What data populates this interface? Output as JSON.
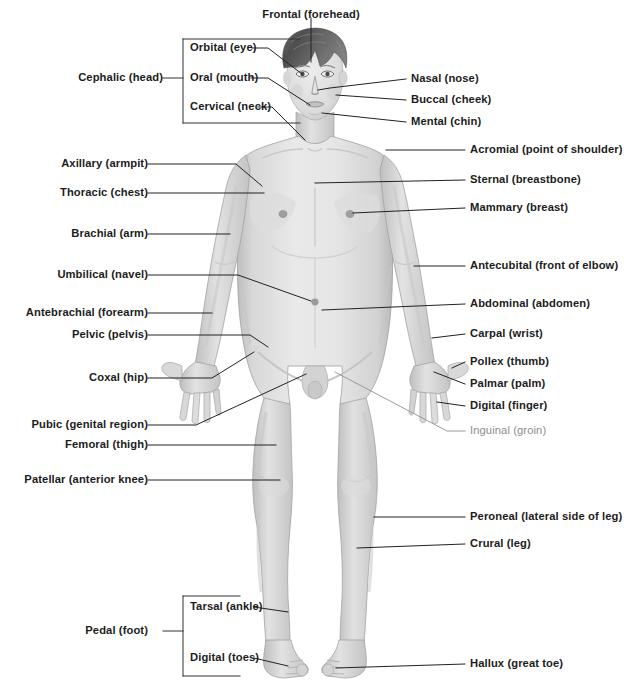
{
  "diagram": {
    "view": "anterior",
    "background_color": "#ffffff",
    "label_color": "#1c1c1c",
    "muted_label_color": "#8d8d8d",
    "leader_line_color": "#222222",
    "bracket_color": "#333333",
    "body_fill": "#d9d9d9",
    "body_outline": "#9a9a9a",
    "hair_color": "#5c5c5c"
  },
  "labels": {
    "frontal": {
      "text": "Frontal (forehead)",
      "align": "center",
      "x": 311,
      "y": 9,
      "muted": false
    },
    "orbital": {
      "text": "Orbital (eye)",
      "align": "right",
      "x": 190,
      "y": 48,
      "muted": false
    },
    "oral": {
      "text": "Oral (mouth)",
      "align": "right",
      "x": 190,
      "y": 78,
      "muted": false
    },
    "cervical": {
      "text": "Cervical (neck)",
      "align": "right",
      "x": 182,
      "y": 106,
      "muted": false
    },
    "cephalic": {
      "text": "Cephalic (head)",
      "align": "left",
      "x": 163,
      "y": 78,
      "muted": false
    },
    "nasal": {
      "text": "Nasal (nose)",
      "align": "right",
      "x": 411,
      "y": 79,
      "muted": false
    },
    "buccal": {
      "text": "Buccal (cheek)",
      "align": "right",
      "x": 411,
      "y": 100,
      "muted": false
    },
    "mental": {
      "text": "Mental (chin)",
      "align": "right",
      "x": 411,
      "y": 122,
      "muted": false
    },
    "acromial": {
      "text": "Acromial (point of shoulder)",
      "align": "right",
      "x": 470,
      "y": 149,
      "muted": false
    },
    "sternal": {
      "text": "Sternal (breastbone)",
      "align": "right",
      "x": 470,
      "y": 179,
      "muted": false
    },
    "mammary": {
      "text": "Mammary (breast)",
      "align": "right",
      "x": 470,
      "y": 207,
      "muted": false
    },
    "antecubital": {
      "text": "Antecubital (front of elbow)",
      "align": "right",
      "x": 470,
      "y": 265,
      "muted": false
    },
    "abdominal": {
      "text": "Abdominal (abdomen)",
      "align": "right",
      "x": 470,
      "y": 303,
      "muted": false
    },
    "carpal": {
      "text": "Carpal (wrist)",
      "align": "right",
      "x": 470,
      "y": 333,
      "muted": false
    },
    "pollex": {
      "text": "Pollex (thumb)",
      "align": "right",
      "x": 470,
      "y": 361,
      "muted": false
    },
    "palmar": {
      "text": "Palmar (palm)",
      "align": "right",
      "x": 470,
      "y": 383,
      "muted": false
    },
    "digital_finger": {
      "text": "Digital (finger)",
      "align": "right",
      "x": 470,
      "y": 405,
      "muted": false
    },
    "inguinal": {
      "text": "Inguinal (groin)",
      "align": "right",
      "x": 470,
      "y": 431,
      "muted": true
    },
    "peroneal": {
      "text": "Peroneal (lateral side of leg)",
      "align": "right",
      "x": 470,
      "y": 516,
      "muted": false
    },
    "crural": {
      "text": "Crural (leg)",
      "align": "right",
      "x": 470,
      "y": 543,
      "muted": false
    },
    "hallux": {
      "text": "Hallux (great toe)",
      "align": "right",
      "x": 470,
      "y": 663,
      "muted": false
    },
    "axillary": {
      "text": "Axillary (armpit)",
      "align": "left",
      "x": 138,
      "y": 163,
      "muted": false
    },
    "thoracic": {
      "text": "Thoracic (chest)",
      "align": "left",
      "x": 138,
      "y": 192,
      "muted": false
    },
    "brachial": {
      "text": "Brachial (arm)",
      "align": "left",
      "x": 138,
      "y": 233,
      "muted": false
    },
    "umbilical": {
      "text": "Umbilical (navel)",
      "align": "left",
      "x": 138,
      "y": 274,
      "muted": false
    },
    "antebrachial": {
      "text": "Antebrachial (forearm)",
      "align": "left",
      "x": 138,
      "y": 312,
      "muted": false
    },
    "pelvic": {
      "text": "Pelvic (pelvis)",
      "align": "left",
      "x": 138,
      "y": 334,
      "muted": false
    },
    "coxal": {
      "text": "Coxal (hip)",
      "align": "left",
      "x": 138,
      "y": 377,
      "muted": false
    },
    "pubic": {
      "text": "Pubic (genital region)",
      "align": "left",
      "x": 138,
      "y": 424,
      "muted": false
    },
    "femoral": {
      "text": "Femoral (thigh)",
      "align": "left",
      "x": 138,
      "y": 444,
      "muted": false
    },
    "patellar": {
      "text": "Patellar (anterior knee)",
      "align": "left",
      "x": 138,
      "y": 479,
      "muted": false
    },
    "pedal": {
      "text": "Pedal (foot)",
      "align": "left",
      "x": 138,
      "y": 631,
      "muted": false
    },
    "tarsal": {
      "text": "Tarsal (ankle)",
      "align": "right",
      "x": 190,
      "y": 606,
      "muted": false
    },
    "digital_toes": {
      "text": "Digital (toes)",
      "align": "right",
      "x": 190,
      "y": 657,
      "muted": false
    }
  },
  "brackets": {
    "cephalic": {
      "name": "cephalic-bracket",
      "x": 183,
      "top": 39,
      "bottom": 123,
      "stem_x": 172,
      "stem_y": 78
    },
    "pedal": {
      "name": "pedal-bracket",
      "x": 183,
      "top": 596,
      "bottom": 676,
      "stem_x": 172,
      "stem_y": 631
    }
  },
  "regions_list": [
    "Frontal (forehead)",
    "Orbital (eye)",
    "Oral (mouth)",
    "Cervical (neck)",
    "Cephalic (head)",
    "Nasal (nose)",
    "Buccal (cheek)",
    "Mental (chin)",
    "Acromial (point of shoulder)",
    "Sternal (breastbone)",
    "Mammary (breast)",
    "Antecubital (front of elbow)",
    "Abdominal (abdomen)",
    "Carpal (wrist)",
    "Pollex (thumb)",
    "Palmar (palm)",
    "Digital (finger)",
    "Inguinal (groin)",
    "Peroneal (lateral side of leg)",
    "Crural (leg)",
    "Hallux (great toe)",
    "Axillary (armpit)",
    "Thoracic (chest)",
    "Brachial (arm)",
    "Umbilical (navel)",
    "Antebrachial (forearm)",
    "Pelvic (pelvis)",
    "Coxal (hip)",
    "Pubic (genital region)",
    "Femoral (thigh)",
    "Patellar (anterior knee)",
    "Pedal (foot)",
    "Tarsal (ankle)",
    "Digital (toes)"
  ]
}
